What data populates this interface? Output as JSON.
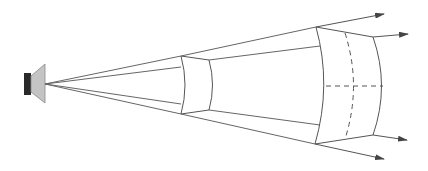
{
  "diagram": {
    "title": "",
    "colors": {
      "line": "#555555",
      "speaker_body": "#2a2a2a",
      "speaker_cone": "#c4c4c4",
      "speaker_cone_stroke": "#8a8a8a",
      "arrow": "#444444"
    },
    "elements": [
      {
        "id": "speaker",
        "type": "loudspeaker-icon"
      },
      {
        "id": "near-wavefront",
        "type": "wavefront-section"
      },
      {
        "id": "far-wavefront",
        "type": "wavefront-section"
      },
      {
        "id": "rays",
        "type": "diverging-rays",
        "count": 4
      }
    ]
  }
}
